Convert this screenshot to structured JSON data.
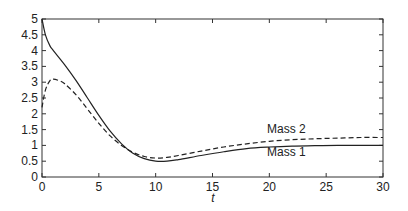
{
  "chart_data": {
    "type": "line",
    "title": "",
    "xlabel": "t",
    "ylabel": "",
    "xlim": [
      0,
      30
    ],
    "ylim": [
      0,
      5
    ],
    "grid": false,
    "legend": "inline labels",
    "x_ticks": [
      "0",
      "5",
      "10",
      "15",
      "20",
      "25",
      "30"
    ],
    "y_ticks": [
      "0",
      "0.5",
      "1",
      "1.5",
      "2",
      "2.5",
      "3",
      "3.5",
      "4",
      "4.5",
      "5"
    ],
    "series": [
      {
        "name": "Mass 1",
        "style": "solid",
        "x": [
          0,
          0.3,
          0.7,
          1,
          2,
          3,
          4,
          5,
          6,
          7,
          8,
          9,
          10,
          11,
          12,
          14,
          16,
          18,
          20,
          22,
          24,
          26,
          28,
          30
        ],
        "values": [
          5.0,
          4.5,
          4.15,
          4.0,
          3.55,
          3.05,
          2.5,
          1.95,
          1.45,
          1.05,
          0.75,
          0.58,
          0.5,
          0.5,
          0.55,
          0.68,
          0.8,
          0.9,
          0.95,
          0.98,
          0.99,
          1.0,
          1.0,
          1.0
        ]
      },
      {
        "name": "Mass 2",
        "style": "dashed",
        "x": [
          0,
          0.3,
          0.7,
          1,
          1.5,
          2,
          3,
          4,
          5,
          6,
          7,
          8,
          9,
          10,
          11,
          12,
          14,
          16,
          18,
          20,
          22,
          24,
          26,
          28,
          30
        ],
        "values": [
          2.2,
          2.75,
          3.05,
          3.1,
          3.05,
          2.95,
          2.6,
          2.15,
          1.7,
          1.3,
          1.0,
          0.78,
          0.65,
          0.6,
          0.62,
          0.68,
          0.82,
          0.95,
          1.05,
          1.13,
          1.18,
          1.21,
          1.23,
          1.25,
          1.25
        ]
      }
    ],
    "annotations": [
      {
        "text": "Mass 2",
        "x": 21.5,
        "y": 1.4
      },
      {
        "text": "Mass 1",
        "x": 21.5,
        "y": 0.65
      }
    ]
  }
}
